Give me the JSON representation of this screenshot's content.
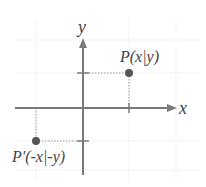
{
  "diagram": {
    "axes": {
      "x_label": "x",
      "y_label": "y"
    },
    "points": [
      {
        "id": "P",
        "label": "P(x|y)",
        "quadrant": "I"
      },
      {
        "id": "P_prime",
        "label": "P'(-x|-y)",
        "quadrant": "III"
      }
    ],
    "colors": {
      "axis": "#7a7a7a",
      "point": "#555555",
      "guide": "#9a9a9a",
      "grid": "#f2f2f2",
      "text": "#444444"
    }
  }
}
